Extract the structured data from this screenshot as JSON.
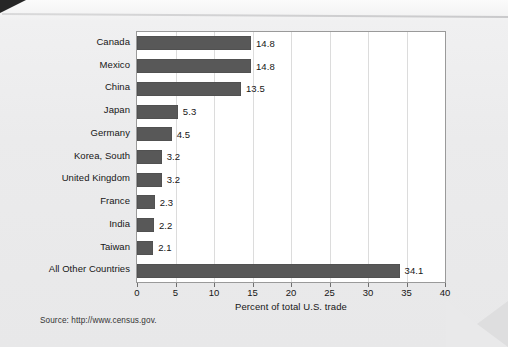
{
  "page": {
    "source_note": "Source: http://www.census.gov."
  },
  "chart_data": {
    "type": "bar",
    "orientation": "horizontal",
    "title": "",
    "xlabel": "Percent of total U.S. trade",
    "ylabel": "",
    "xlim": [
      0,
      40
    ],
    "xticks": [
      0,
      5,
      10,
      15,
      20,
      25,
      30,
      35,
      40
    ],
    "xtick_labels": [
      "0",
      "5",
      "10",
      "15",
      "20",
      "25",
      "30",
      "35",
      "40"
    ],
    "grid": "vertical",
    "legend": "none",
    "bar_color": "#585858",
    "plot_background": "#ffffff",
    "categories": [
      "Canada",
      "Mexico",
      "China",
      "Japan",
      "Germany",
      "Korea, South",
      "United Kingdom",
      "France",
      "India",
      "Taiwan",
      "All Other Countries"
    ],
    "values": [
      14.8,
      14.8,
      13.5,
      5.3,
      4.5,
      3.2,
      3.2,
      2.3,
      2.2,
      2.1,
      34.1
    ],
    "value_labels": [
      "14.8",
      "14.8",
      "13.5",
      "5.3",
      "4.5",
      "3.2",
      "3.2",
      "2.3",
      "2.2",
      "2.1",
      "34.1"
    ]
  }
}
